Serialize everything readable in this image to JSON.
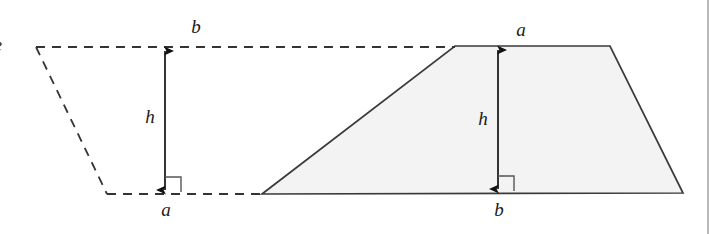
{
  "figure": {
    "background_color": "#ffffff",
    "width": 721,
    "height": 234
  },
  "style": {
    "solid_stroke_color": "#3a3a3a",
    "dashed_stroke_color": "#333333",
    "shape_fill_color": "#f3f3f3",
    "dimension_color": "#111111",
    "right_angle_color": "#555555",
    "page_rule_color": "#b9b9b9"
  },
  "left_shape": {
    "name": "dashed-inverted-trapezoid",
    "style": "dashed",
    "filled": false,
    "top_edge_label": "b",
    "bottom_edge_label": "a",
    "height_label": "h",
    "vertices": [
      {
        "x": 36,
        "y": 47
      },
      {
        "x": 455,
        "y": 47
      },
      {
        "x": 262,
        "y": 194
      },
      {
        "x": 107,
        "y": 194
      }
    ]
  },
  "right_shape": {
    "name": "solid-trapezoid",
    "style": "solid",
    "filled": true,
    "top_edge_label": "a",
    "bottom_edge_label": "b",
    "height_label": "h",
    "vertices": [
      {
        "x": 455,
        "y": 46
      },
      {
        "x": 610,
        "y": 46
      },
      {
        "x": 683,
        "y": 193
      },
      {
        "x": 262,
        "y": 194
      }
    ]
  },
  "labels": {
    "left_top": "b",
    "left_height": "h",
    "left_bottom": "a",
    "right_top": "a",
    "right_height": "h",
    "right_bottom": "b",
    "cropped_edge_glyph": "e"
  },
  "dimension_arrows": [
    {
      "name": "left-height-arrow",
      "x": 165,
      "y_top": 47,
      "y_bottom": 194,
      "label": "h",
      "double_headed": true,
      "right_angle_marker": true
    },
    {
      "name": "right-height-arrow",
      "x": 498,
      "y_top": 46,
      "y_bottom": 193,
      "label": "h",
      "double_headed": true,
      "right_angle_marker": true
    }
  ],
  "page_rule": {
    "name": "page-margin-rule",
    "x": 708,
    "y_top": 0,
    "y_bottom": 234
  }
}
